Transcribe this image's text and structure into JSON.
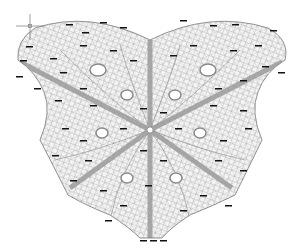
{
  "drawing": {
    "title": "Gridshell roof plan",
    "background": "#ffffff",
    "mesh_color": "#8a8a8a",
    "beam_color": "#9a9a9a",
    "opening_fill": "#ffffff",
    "label_color": "#111111"
  },
  "cursor": {
    "type": "crosshair",
    "x": 30,
    "y": 26
  },
  "openings": [
    {
      "cx": 98,
      "cy": 70,
      "rx": 8,
      "ry": 6
    },
    {
      "cx": 208,
      "cy": 70,
      "rx": 8,
      "ry": 6
    },
    {
      "cx": 127,
      "cy": 95,
      "rx": 6,
      "ry": 5
    },
    {
      "cx": 175,
      "cy": 95,
      "rx": 6,
      "ry": 5
    },
    {
      "cx": 102,
      "cy": 133,
      "rx": 6,
      "ry": 5
    },
    {
      "cx": 200,
      "cy": 133,
      "rx": 6,
      "ry": 5
    },
    {
      "cx": 127,
      "cy": 178,
      "rx": 6,
      "ry": 5
    },
    {
      "cx": 176,
      "cy": 178,
      "rx": 6,
      "ry": 5
    }
  ],
  "beams": [
    {
      "x1": 20,
      "y1": 62,
      "x2": 150,
      "y2": 130
    },
    {
      "x1": 282,
      "y1": 62,
      "x2": 150,
      "y2": 130
    },
    {
      "x1": 70,
      "y1": 188,
      "x2": 150,
      "y2": 130
    },
    {
      "x1": 232,
      "y1": 188,
      "x2": 150,
      "y2": 130
    },
    {
      "x1": 150,
      "y1": 40,
      "x2": 150,
      "y2": 238
    }
  ]
}
